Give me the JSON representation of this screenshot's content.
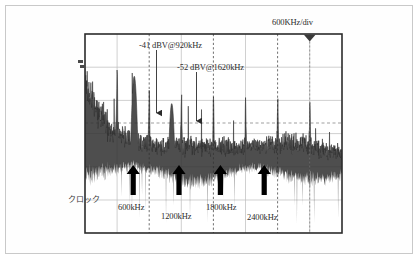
{
  "figure": {
    "kind": "spectrum-analyzer-screen-capture",
    "colors": {
      "background": "#ffffff",
      "frame": "#c9c9c9",
      "plot_border": "#2b2b2b",
      "grid_solid": "#b9b9b9",
      "grid_dashed": "#555555",
      "trace": "#2a2a2a",
      "annotation": "#2b2b2b",
      "arrow": "#000000"
    }
  },
  "labels": {
    "div_scale": "600KHz/div",
    "annotation_1": "-41 dBV@920kHz",
    "annotation_2": "-52 dBV@1620kHz",
    "clock": "クロック",
    "harmonic_1": "600kHz",
    "harmonic_2": "1200kHz",
    "harmonic_3": "1800kHz",
    "harmonic_4": "2400kHz",
    "level_marker": "▲"
  },
  "chart_data": {
    "type": "line",
    "title": "",
    "subtitle": "",
    "xlabel": "",
    "ylabel": "",
    "x_unit": "kHz",
    "y_unit": "dBV",
    "x_per_division": 600,
    "x_division_label": "600KHz/div",
    "grid": true,
    "legend_position": "none",
    "x_divisions": 8,
    "y_divisions": 6,
    "xlim": [
      0,
      4800
    ],
    "ylim": [
      -100,
      -20
    ],
    "series": [
      {
        "name": "switching-noise-spectrum",
        "description": "broadband switching noise floor with harmonic spurs",
        "noise_floor_dbv": -70,
        "noise_peak_dbv": -55
      }
    ],
    "annotations": [
      {
        "text": "-41 dBV@920kHz",
        "freq_khz": 920,
        "level_dbv": -41,
        "marker": "down-arrow"
      },
      {
        "text": "-52 dBV@1620kHz",
        "freq_khz": 1620,
        "level_dbv": -52,
        "marker": "down-arrow"
      }
    ],
    "harmonic_markers": [
      {
        "label": "600kHz",
        "freq_khz": 600,
        "marker": "up-arrow"
      },
      {
        "label": "1200kHz",
        "freq_khz": 1200,
        "marker": "up-arrow"
      },
      {
        "label": "1800kHz",
        "freq_khz": 1800,
        "marker": "up-arrow"
      },
      {
        "label": "2400kHz",
        "freq_khz": 2400,
        "marker": "up-arrow"
      }
    ],
    "clock_marker": {
      "label": "クロック",
      "freq_khz": 0
    },
    "top_cursor": {
      "label": "600KHz/div",
      "freq_khz": 3900,
      "marker": "down-triangle"
    }
  }
}
